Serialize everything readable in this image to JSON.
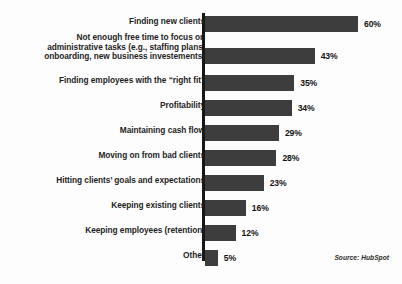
{
  "chart_data": {
    "type": "bar",
    "orientation": "horizontal",
    "title": "",
    "xlabel": "",
    "ylabel": "",
    "xlim": [
      0,
      60
    ],
    "grid": false,
    "legend": false,
    "value_suffix": "%",
    "categories": [
      "Finding new clients",
      "Not enough free time to focus on\nadministrative tasks (e.g., staffing plans,\nonboarding, new business investements)",
      "Finding employees with the “right fit”",
      "Profitability",
      "Maintaining cash flow",
      "Moving on from bad clients",
      "Hitting clients’ goals and expectations",
      "Keeping existing clients",
      "Keeping employees (retention)",
      "Other"
    ],
    "values": [
      60,
      43,
      35,
      34,
      29,
      28,
      23,
      16,
      12,
      5
    ],
    "value_labels": [
      "60%",
      "43%",
      "35%",
      "34%",
      "29%",
      "28%",
      "23%",
      "16%",
      "12%",
      "5%"
    ],
    "bar_color": "#3d3d3d",
    "axis_color": "#171717",
    "background_color": "#fdfdfd"
  },
  "source": {
    "text": "Source: HubSpot"
  }
}
